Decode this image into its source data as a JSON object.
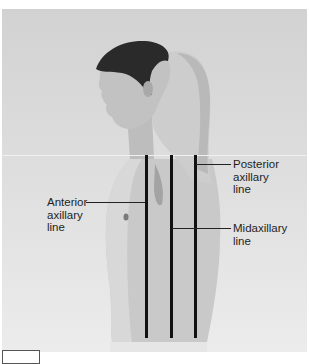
{
  "figure": {
    "lines": [
      {
        "id": "anterior",
        "label_lines": [
          "Anterior",
          "axillary",
          "line"
        ]
      },
      {
        "id": "mid",
        "label_lines": [
          "Midaxillary",
          "line"
        ]
      },
      {
        "id": "posterior",
        "label_lines": [
          "Posterior",
          "axillary",
          "line"
        ]
      }
    ]
  },
  "colors": {
    "background": "#dcdcdc",
    "lines": "#111111",
    "text": "#1e1e1e"
  }
}
